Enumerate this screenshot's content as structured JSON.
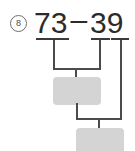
{
  "problem": {
    "number_label": "8",
    "minuend": "73",
    "operator": "–",
    "subtrahend_tens": "3",
    "subtrahend_ones": "9",
    "equation_text": "73 – 39"
  },
  "answers": {
    "box_1_value": "",
    "box_2_value": ""
  },
  "colors": {
    "background": "#ffffff",
    "text": "#2b2b2b",
    "stroke": "#4b4b4b",
    "underline": "#3a3a3a",
    "answer_box_fill": "#d4d4d4",
    "problem_number": "#4a4a4a"
  }
}
